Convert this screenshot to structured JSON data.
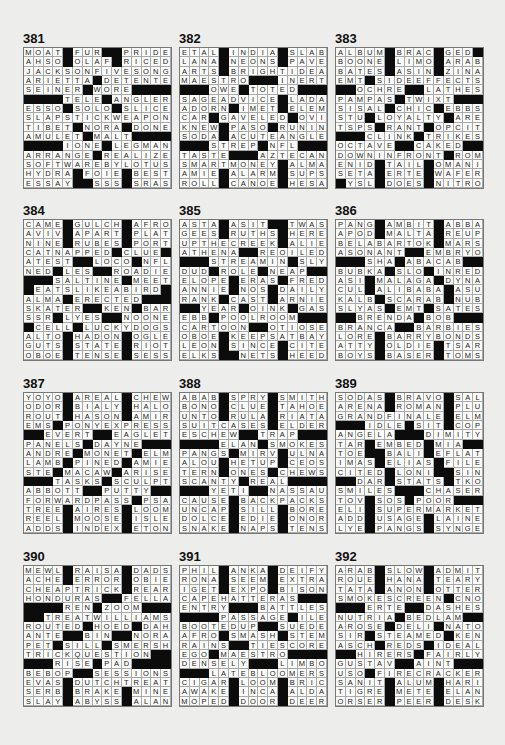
{
  "page": {
    "background": "#ededeb",
    "black_square_color": "#0c0c0c",
    "black_square_marker": "#"
  },
  "puzzles": [
    {
      "number": "381",
      "rows": [
        "MOAT#FUR##PRIDE",
        "AHSO#OLAF#RICED",
        "JACKSONFIVESONG",
        "ARIETTA#DETENTE",
        "SEINER#WORE####",
        "####TELE#ANGLER",
        "ESSO#SOLO#SLICE",
        "SLAPSTICKWEAPON",
        "TIBET#NORA#DONE",
        "AMULET#MALT####",
        "####IONE#LEGMAN",
        "ARRANGE#REALIZE",
        "SOFTWAREBYLOTUS",
        "HYDRA#FOIE#BEST",
        "ESSAY##SSS#SRAS"
      ]
    },
    {
      "number": "382",
      "rows": [
        "ETAL#INDIA#SLAB",
        "LANA#NEONS#PAVE",
        "ARTS#BRIGHTIDEA",
        "MAESTRO###INERT",
        "###OWE#TOTED###",
        "SAGEADVICE#LADA",
        "ADORN#IMET#ELEM",
        "CAR#GAVELED#OVI",
        "KNEW#PASO#RUNIN",
        "SODA#ACUTEANGLE",
        "###STREP#NFL###",
        "TASTE###AZTECAN",
        "SMARTMONEY#ALMA",
        "AMIE#ALARM#SUPS",
        "ROLL#CANOE#HESA"
      ]
    },
    {
      "number": "383",
      "rows": [
        "ALBUM#BRAC#GED#",
        "BOONE#LIMO#ARAB",
        "BATES#ASIN#ZINA",
        "EMT#SIDEEFFECTS",
        "##OCHRE##LATHES",
        "PAMPAS#TWIXT###",
        "SISAL#CHIC#EBBS",
        "STU#LOYALTY#ARE",
        "TSPS#RANT#OPCIT",
        "###CLINK#TRIKES",
        "OCTAVE##CAKED##",
        "DOWNINFRONT#ROM",
        "ENID#TAIL#OMANI",
        "SETA#ERTE#WAFER",
        "#YSL#DOES#NITRO"
      ]
    },
    {
      "number": "384",
      "rows": [
        "CAME#GULCH#AFRO",
        "AVIV#APART#PLAT",
        "NINE#RUBES#PORT",
        "CATNAPPED#CLUE#",
        "ATEST##LOCO#NFL",
        "NED#LES##ROADIE",
        "###SALTINE#MEET",
        "#EATSLIKEABIRD#",
        "ALMA#ERECTED###",
        "SKATER##KEN#BAR",
        "SSR#LYES##NOONE",
        "#CELL#LUCKYDOGS",
        "ALTO#HADON#OGLE",
        "GUTS#STATE#RIOT",
        "OBOE#TENSE#SESS"
      ]
    },
    {
      "number": "385",
      "rows": [
        "ASTA#ASIT##TWAS",
        "GEES#RUTHS#HERE",
        "UPTHECREEK#ALIE",
        "ATHENA##REOILED",
        "###STREAMIN#SLY",
        "DUD#ROLE#NEAP##",
        "ELOPE#ERAS#FRED",
        "ANNIE#NOS#DAILY",
        "RANK#CAST#ARNIE",
        "##YEAR#OINK#GAS",
        "EBB#POOLROOM###",
        "CARTOON##OTIOSE",
        "OBOE#KEEPSATBAY",
        "LEON#SINCE#CITE",
        "ELKS##NETS#HEED"
      ]
    },
    {
      "number": "386",
      "rows": [
        "PANG#AMBIT#ABBA",
        "APOD#MALTA#REUP",
        "BELABARTOK#MARS",
        "ASONANT##EMBRYO",
        "###SHA#ABACAB##",
        "BUBKA#SLO#INRED",
        "ASI#MALAGA#DYNA",
        "CUL#ALIBABA#ASU",
        "KALB#SCARAB#NUB",
        "SLYAS#EMT#SATES",
        "##BRENDA#BOB###",
        "BRANCA##BARBIES",
        "LORE#BARRYBONDS",
        "ATTY#OLDIE#TSAR",
        "BOYS#BASER#TOMS"
      ]
    },
    {
      "number": "387",
      "rows": [
        "YOYO#AREAL#CHEW",
        "ODOR#BIALY#HALO",
        "ROUT#HASON#AMIR",
        "EMS#PONYEXPRESS",
        "##EVERT##EAGLET",
        "PANELS#DAYNE###",
        "ANDRE#MONET#ELM",
        "LAMB#PINED#AMIE",
        "STE#MACAW#ARISE",
        "###TASKS#SCULPT",
        "ABBOTT##PUTTY##",
        "FORWARDPASS#PSA",
        "TREE#AIRES#LOOM",
        "REEL#MOOSE#ISLE",
        "ADDS#INDEX#ETON"
      ]
    },
    {
      "number": "388",
      "rows": [
        "ABAB#SPRY#SMITH",
        "BONO#CLUE#TAHOE",
        "UNTO#RULA#RIATA",
        "SUITCASES#ELDER",
        "ESCHEW##TRAP###",
        "####ELAN#SMOKES",
        "PANGS#MIRV#ULNA",
        "ALOU#HETUP#CEOS",
        "TERN#ONES#CHEWS",
        "SCANTY#REAL####",
        "###YETI##NASSAU",
        "CAUSE#BACKPACKS",
        "UNCAP#SILL#BORE",
        "DOLCE#EDIE#ONOR",
        "SNAKE#NAPS#TENS"
      ]
    },
    {
      "number": "389",
      "rows": [
        "SODAS#BRAVO#SAL",
        "ARENA#ROMAN#PLU",
        "GRANDFINALE#ELM",
        "###IDLE#SIT#COP",
        "ANGELA###DIMITY",
        "TAR#EMBED#MIA##",
        "TOE##BALI#EFLAT",
        "IMAS#ELIAS#FILE",
        "CITED#LONI##SIN",
        "##DAR#STATS#TKO",
        "SMILES###CHASER",
        "TOV#SOS#POOR###",
        "ELI#SUPERMARKET",
        "ADD#USAGE#LAINE",
        "LYE#PANGS#SYNGE"
      ]
    },
    {
      "number": "390",
      "rows": [
        "MEWL#RAISA#DADS",
        "ACHE#ERROR#OBIE",
        "CHEAPTRICK#REAR",
        "HONDURAS##FELLA",
        "####REN#ZOOM###",
        "##TREATWILLIAMS",
        "ROUTED#HOED#DAH",
        "ANTE##BIN##NORA",
        "PET#SILL#SMERSH",
        "TRICKQUESTION##",
        "###RISE#PAD####",
        "BEBOP##SESSIONS",
        "EVAS#DUTCHTREAT",
        "SERB#BRAKE#MINE",
        "SLAY#ABYSS#ALAN"
      ]
    },
    {
      "number": "391",
      "rows": [
        "PHIL#ANKA#DEIFY",
        "RONA#SEEM#EXTRA",
        "IGET#EXPO#BISON",
        "CAPEHATTERAS###",
        "ENTRY###BATTLES",
        "####PASSAGE#ILE",
        "BOOTEDUP##SUEDE",
        "AFRO#SMASH#STEM",
        "RAINS##TIESCORE",
        "EGO#MAESTRO####",
        "DENSELY###LIMBO",
        "###LATEBLOOMERS",
        "CIGAR#LOOM#BRIC",
        "AWAKE#INCA#ALDA",
        "MOPED#DOOR#DEER"
      ]
    },
    {
      "number": "392",
      "rows": [
        "ARAB#SLOW#ADMIT",
        "ROUE#HANA#TEARY",
        "TATA#ANON#OTTER",
        "SMOKESCREEN#CNO",
        "###ERTE##DASHES",
        "NUTRIA#BEDLAM##",
        "AROSE#DELI#NATO",
        "SIR#STEAMED#KEN",
        "ASCH#REDS#IDEAL",
        "##HIRERS#FAIRLY",
        "GUSTAV##AINT###",
        "USO#FIRECRACKER",
        "SANIT#ALUM#HARI",
        "TIGRE#METE#ELAN",
        "ORSER#PEER#DESK"
      ]
    }
  ]
}
